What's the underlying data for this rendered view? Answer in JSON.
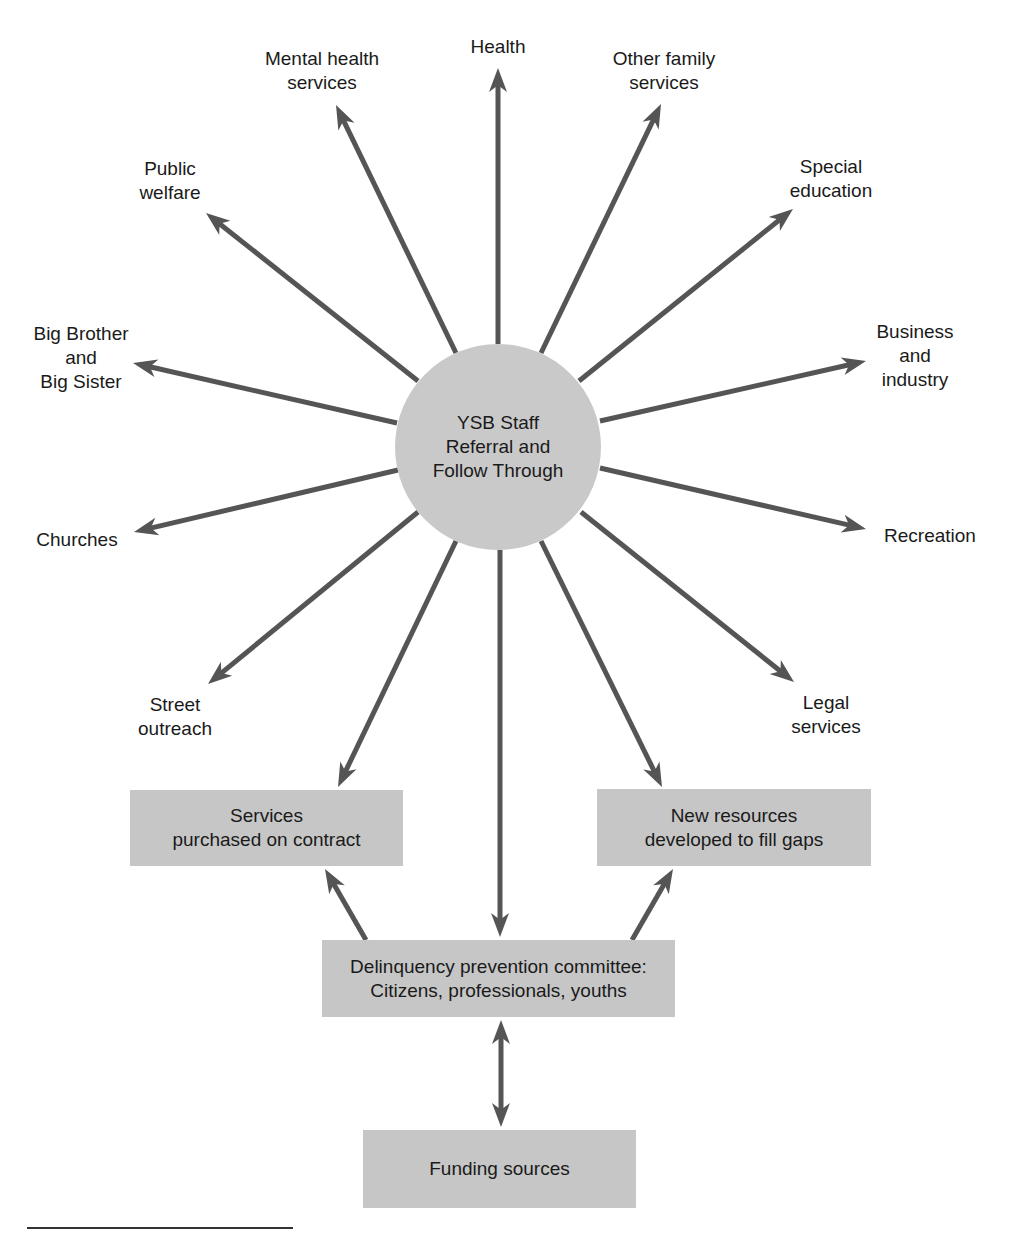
{
  "hub": {
    "lines": [
      "YSB Staff",
      "Referral and",
      "Follow Through"
    ]
  },
  "spokes": [
    {
      "id": "health",
      "lines": [
        "Health"
      ],
      "label_x": 498,
      "label_y": 35,
      "from": [
        498,
        344
      ],
      "to": [
        498,
        68
      ]
    },
    {
      "id": "mental-health-services",
      "lines": [
        "Mental health",
        "services"
      ],
      "label_x": 322,
      "label_y": 47,
      "from": [
        456,
        353
      ],
      "to": [
        336,
        105
      ]
    },
    {
      "id": "other-family-services",
      "lines": [
        "Other family",
        "services"
      ],
      "label_x": 664,
      "label_y": 47,
      "from": [
        541,
        353
      ],
      "to": [
        661,
        104
      ]
    },
    {
      "id": "public-welfare",
      "lines": [
        "Public",
        "welfare"
      ],
      "label_x": 170,
      "label_y": 157,
      "from": [
        418,
        381
      ],
      "to": [
        206,
        213
      ]
    },
    {
      "id": "special-education",
      "lines": [
        "Special",
        "education"
      ],
      "label_x": 831,
      "label_y": 155,
      "from": [
        579,
        381
      ],
      "to": [
        793,
        209
      ]
    },
    {
      "id": "big-brother-big-sister",
      "lines": [
        "Big Brother",
        "and",
        "Big Sister"
      ],
      "label_x": 81,
      "label_y": 322,
      "from": [
        397,
        423
      ],
      "to": [
        133,
        363
      ]
    },
    {
      "id": "business-and-industry",
      "lines": [
        "Business",
        "and",
        "industry"
      ],
      "label_x": 915,
      "label_y": 320,
      "from": [
        600,
        421
      ],
      "to": [
        866,
        361
      ]
    },
    {
      "id": "churches",
      "lines": [
        "Churches"
      ],
      "label_x": 77,
      "label_y": 528,
      "from": [
        398,
        470
      ],
      "to": [
        134,
        532
      ]
    },
    {
      "id": "recreation",
      "lines": [
        "Recreation"
      ],
      "label_x": 930,
      "label_y": 524,
      "from": [
        600,
        468
      ],
      "to": [
        866,
        529
      ]
    },
    {
      "id": "street-outreach",
      "lines": [
        "Street",
        "outreach"
      ],
      "label_x": 175,
      "label_y": 693,
      "from": [
        418,
        512
      ],
      "to": [
        208,
        684
      ]
    },
    {
      "id": "legal-services",
      "lines": [
        "Legal",
        "services"
      ],
      "label_x": 826,
      "label_y": 691,
      "from": [
        581,
        512
      ],
      "to": [
        794,
        682
      ]
    }
  ],
  "boxes": [
    {
      "id": "services-purchased-on-contract",
      "lines": [
        "Services",
        "purchased on contract"
      ],
      "x": 130,
      "y": 790,
      "w": 273,
      "h": 76
    },
    {
      "id": "new-resources-developed",
      "lines": [
        "New resources",
        "developed to fill gaps"
      ],
      "x": 597,
      "y": 789,
      "w": 274,
      "h": 77
    },
    {
      "id": "delinquency-prevention-committee",
      "lines": [
        "Delinquency prevention committee:",
        "Citizens, professionals, youths"
      ],
      "x": 322,
      "y": 940,
      "w": 353,
      "h": 77
    },
    {
      "id": "funding-sources",
      "lines": [
        "Funding sources"
      ],
      "x": 363,
      "y": 1130,
      "w": 273,
      "h": 78
    }
  ],
  "connectors": [
    {
      "id": "hub-to-services",
      "from": [
        456,
        541
      ],
      "to": [
        338,
        787
      ],
      "double": false
    },
    {
      "id": "hub-to-new-resources",
      "from": [
        541,
        541
      ],
      "to": [
        662,
        787
      ],
      "double": false
    },
    {
      "id": "hub-to-committee",
      "from": [
        500,
        550
      ],
      "to": [
        500,
        937
      ],
      "double": false
    },
    {
      "id": "committee-to-services",
      "from": [
        366,
        940
      ],
      "to": [
        325,
        869
      ],
      "double": false
    },
    {
      "id": "committee-to-new-resources",
      "from": [
        632,
        940
      ],
      "to": [
        673,
        869
      ],
      "double": false
    },
    {
      "id": "committee-funding",
      "from": [
        501,
        1020
      ],
      "to": [
        501,
        1127
      ],
      "double": true
    }
  ],
  "colors": {
    "line": "#555555",
    "hub_fill": "#c9c9c9",
    "box_fill": "#c6c6c6",
    "text": "#1a1a1a"
  }
}
